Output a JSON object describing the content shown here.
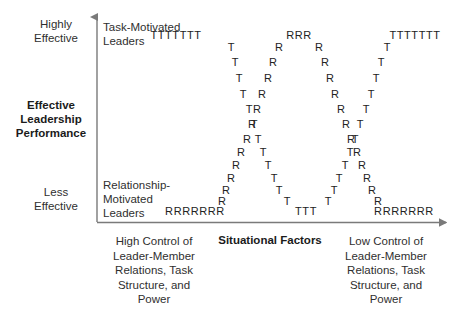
{
  "figure": {
    "y_axis": {
      "title": "Effective\nLeadership\nPerformance",
      "top_label": "Highly\nEffective",
      "bottom_label": "Less\nEffective"
    },
    "x_axis": {
      "title": "Situational Factors",
      "left_label": "High Control of\nLeader-Member\nRelations, Task\nStructure, and\nPower",
      "right_label": "Low Control of\nLeader-Member\nRelations, Task\nStructure, and\nPower"
    },
    "series_labels": {
      "task": "Task-Motivated\nLeaders",
      "relationship": "Relationship-\nMotivated\nLeaders"
    },
    "colors": {
      "axis": "#7a7a7a",
      "mark": "#222222",
      "text": "#2f2f2f",
      "title": "#1b1b1b",
      "background": "#ffffff"
    }
  },
  "chart_data": {
    "type": "scatter",
    "title": "",
    "xlabel": "Situational Factors",
    "ylabel": "Effective Leadership Performance",
    "xlim": [
      0,
      1
    ],
    "ylim": [
      0,
      1
    ],
    "grid": false,
    "legend": "in-plot text labels",
    "x_tick_labels": [
      "High Control of Leader-Member Relations, Task Structure, and Power",
      "Low Control of Leader-Member Relations, Task Structure, and Power"
    ],
    "y_tick_labels": [
      "Less Effective",
      "Highly Effective"
    ],
    "annotations": [
      "Task-Motivated Leaders",
      "Relationship-Motivated Leaders"
    ],
    "series": [
      {
        "name": "Task-Motivated Leaders",
        "marker": "T",
        "description": "High at both extremes of situational control, dipping to a low in the middle (U / W-shaped across the range).",
        "points": [
          {
            "x": 176,
            "y": 35,
            "label": "TTTTTTT",
            "run": true
          },
          {
            "x": 231,
            "y": 47,
            "label": "T"
          },
          {
            "x": 235,
            "y": 62,
            "label": "T"
          },
          {
            "x": 239,
            "y": 78,
            "label": "T"
          },
          {
            "x": 243,
            "y": 94,
            "label": "T"
          },
          {
            "x": 249,
            "y": 109,
            "label": "T"
          },
          {
            "x": 254,
            "y": 124,
            "label": "T"
          },
          {
            "x": 258,
            "y": 139,
            "label": "T"
          },
          {
            "x": 263,
            "y": 152,
            "label": "T"
          },
          {
            "x": 268,
            "y": 165,
            "label": "T"
          },
          {
            "x": 274,
            "y": 178,
            "label": "T"
          },
          {
            "x": 279,
            "y": 190,
            "label": "T"
          },
          {
            "x": 287,
            "y": 201,
            "label": "T"
          },
          {
            "x": 306,
            "y": 211,
            "label": "TTT",
            "run": true
          },
          {
            "x": 328,
            "y": 201,
            "label": "T"
          },
          {
            "x": 334,
            "y": 190,
            "label": "T"
          },
          {
            "x": 339,
            "y": 178,
            "label": "T"
          },
          {
            "x": 345,
            "y": 165,
            "label": "T"
          },
          {
            "x": 350,
            "y": 152,
            "label": "T"
          },
          {
            "x": 355,
            "y": 139,
            "label": "T"
          },
          {
            "x": 360,
            "y": 124,
            "label": "T"
          },
          {
            "x": 366,
            "y": 109,
            "label": "T"
          },
          {
            "x": 371,
            "y": 94,
            "label": "T"
          },
          {
            "x": 376,
            "y": 78,
            "label": "T"
          },
          {
            "x": 381,
            "y": 62,
            "label": "T"
          },
          {
            "x": 387,
            "y": 47,
            "label": "T"
          },
          {
            "x": 415,
            "y": 35,
            "label": "TTTTTTT",
            "run": true
          }
        ]
      },
      {
        "name": "Relationship-Motivated Leaders",
        "marker": "R",
        "description": "Low at both extremes of situational control, peaking in the middle of the range (inverted-U / M-shaped across the range).",
        "points": [
          {
            "x": 195,
            "y": 211,
            "label": "RRRRRRR",
            "run": true
          },
          {
            "x": 222,
            "y": 201,
            "label": "R"
          },
          {
            "x": 226,
            "y": 190,
            "label": "R"
          },
          {
            "x": 231,
            "y": 178,
            "label": "R"
          },
          {
            "x": 236,
            "y": 165,
            "label": "R"
          },
          {
            "x": 241,
            "y": 152,
            "label": "R"
          },
          {
            "x": 247,
            "y": 139,
            "label": "R"
          },
          {
            "x": 252,
            "y": 124,
            "label": "R"
          },
          {
            "x": 257,
            "y": 109,
            "label": "R"
          },
          {
            "x": 262,
            "y": 94,
            "label": "R"
          },
          {
            "x": 268,
            "y": 78,
            "label": "R"
          },
          {
            "x": 273,
            "y": 62,
            "label": "R"
          },
          {
            "x": 279,
            "y": 47,
            "label": "R"
          },
          {
            "x": 299,
            "y": 35,
            "label": "RRR",
            "run": true
          },
          {
            "x": 319,
            "y": 47,
            "label": "R"
          },
          {
            "x": 325,
            "y": 62,
            "label": "R"
          },
          {
            "x": 330,
            "y": 78,
            "label": "R"
          },
          {
            "x": 335,
            "y": 94,
            "label": "R"
          },
          {
            "x": 341,
            "y": 109,
            "label": "R"
          },
          {
            "x": 346,
            "y": 124,
            "label": "R"
          },
          {
            "x": 351,
            "y": 139,
            "label": "R"
          },
          {
            "x": 357,
            "y": 152,
            "label": "R"
          },
          {
            "x": 362,
            "y": 165,
            "label": "R"
          },
          {
            "x": 367,
            "y": 178,
            "label": "R"
          },
          {
            "x": 372,
            "y": 190,
            "label": "R"
          },
          {
            "x": 378,
            "y": 201,
            "label": "R"
          },
          {
            "x": 404,
            "y": 211,
            "label": "RRRRRRR",
            "run": true
          }
        ]
      }
    ]
  }
}
